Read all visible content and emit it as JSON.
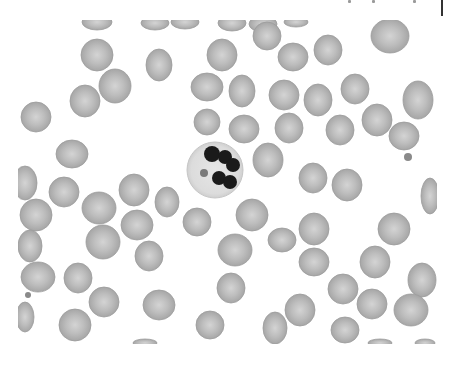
{
  "image": {
    "subject": "Peripheral blood smear micrograph (grayscale) showing a central segmented neutrophil surrounded by red blood cells",
    "frame": {
      "x": 18,
      "y": 20,
      "width": 419,
      "height": 324
    },
    "colors": {
      "background": "#ffffff",
      "rbc_fill": "#b9b9b9",
      "rbc_edge": "#9c9c9c",
      "rbc_center": "#d6d6d6",
      "wbc_cytoplasm": "#dedede",
      "wbc_nucleus": "#1a1a1a",
      "platelet": "#8a8a8a"
    },
    "neutrophil": {
      "cx": 215,
      "cy": 170,
      "r": 28,
      "lobes": [
        {
          "cx": 212,
          "cy": 154,
          "r": 8
        },
        {
          "cx": 225,
          "cy": 157,
          "r": 7
        },
        {
          "cx": 233,
          "cy": 165,
          "r": 7
        },
        {
          "cx": 219,
          "cy": 178,
          "r": 7
        },
        {
          "cx": 230,
          "cy": 182,
          "r": 7
        }
      ],
      "granule": {
        "cx": 204,
        "cy": 173,
        "r": 4
      }
    },
    "red_cells": [
      {
        "cx": 97,
        "cy": 22,
        "rx": 15,
        "ry": 8
      },
      {
        "cx": 155,
        "cy": 23,
        "rx": 14,
        "ry": 7
      },
      {
        "cx": 185,
        "cy": 22,
        "rx": 14,
        "ry": 7
      },
      {
        "cx": 232,
        "cy": 23,
        "rx": 14,
        "ry": 8
      },
      {
        "cx": 263,
        "cy": 24,
        "rx": 14,
        "ry": 8
      },
      {
        "cx": 296,
        "cy": 22,
        "rx": 12,
        "ry": 5
      },
      {
        "cx": 390,
        "cy": 36,
        "rx": 19,
        "ry": 17
      },
      {
        "cx": 97,
        "cy": 55,
        "rx": 16,
        "ry": 16
      },
      {
        "cx": 159,
        "cy": 65,
        "rx": 13,
        "ry": 16
      },
      {
        "cx": 222,
        "cy": 55,
        "rx": 15,
        "ry": 16
      },
      {
        "cx": 267,
        "cy": 36,
        "rx": 14,
        "ry": 14
      },
      {
        "cx": 293,
        "cy": 57,
        "rx": 15,
        "ry": 14
      },
      {
        "cx": 328,
        "cy": 50,
        "rx": 14,
        "ry": 15
      },
      {
        "cx": 115,
        "cy": 86,
        "rx": 16,
        "ry": 17
      },
      {
        "cx": 85,
        "cy": 101,
        "rx": 15,
        "ry": 16
      },
      {
        "cx": 207,
        "cy": 87,
        "rx": 16,
        "ry": 14
      },
      {
        "cx": 242,
        "cy": 91,
        "rx": 13,
        "ry": 16
      },
      {
        "cx": 284,
        "cy": 95,
        "rx": 15,
        "ry": 15
      },
      {
        "cx": 318,
        "cy": 100,
        "rx": 14,
        "ry": 16
      },
      {
        "cx": 355,
        "cy": 89,
        "rx": 14,
        "ry": 15
      },
      {
        "cx": 418,
        "cy": 100,
        "rx": 15,
        "ry": 19
      },
      {
        "cx": 36,
        "cy": 117,
        "rx": 15,
        "ry": 15
      },
      {
        "cx": 207,
        "cy": 122,
        "rx": 13,
        "ry": 13
      },
      {
        "cx": 244,
        "cy": 129,
        "rx": 15,
        "ry": 14
      },
      {
        "cx": 289,
        "cy": 128,
        "rx": 14,
        "ry": 15
      },
      {
        "cx": 340,
        "cy": 130,
        "rx": 14,
        "ry": 15
      },
      {
        "cx": 377,
        "cy": 120,
        "rx": 15,
        "ry": 16
      },
      {
        "cx": 404,
        "cy": 136,
        "rx": 15,
        "ry": 14
      },
      {
        "cx": 72,
        "cy": 154,
        "rx": 16,
        "ry": 14
      },
      {
        "cx": 268,
        "cy": 160,
        "rx": 15,
        "ry": 17
      },
      {
        "cx": 313,
        "cy": 178,
        "rx": 14,
        "ry": 15
      },
      {
        "cx": 347,
        "cy": 185,
        "rx": 15,
        "ry": 16
      },
      {
        "cx": 25,
        "cy": 183,
        "rx": 12,
        "ry": 17
      },
      {
        "cx": 64,
        "cy": 192,
        "rx": 15,
        "ry": 15
      },
      {
        "cx": 134,
        "cy": 190,
        "rx": 15,
        "ry": 16
      },
      {
        "cx": 99,
        "cy": 208,
        "rx": 17,
        "ry": 16
      },
      {
        "cx": 167,
        "cy": 202,
        "rx": 12,
        "ry": 15
      },
      {
        "cx": 197,
        "cy": 222,
        "rx": 14,
        "ry": 14
      },
      {
        "cx": 252,
        "cy": 215,
        "rx": 16,
        "ry": 16
      },
      {
        "cx": 430,
        "cy": 196,
        "rx": 9,
        "ry": 18
      },
      {
        "cx": 36,
        "cy": 215,
        "rx": 16,
        "ry": 16
      },
      {
        "cx": 137,
        "cy": 225,
        "rx": 16,
        "ry": 15
      },
      {
        "cx": 314,
        "cy": 229,
        "rx": 15,
        "ry": 16
      },
      {
        "cx": 394,
        "cy": 229,
        "rx": 16,
        "ry": 16
      },
      {
        "cx": 30,
        "cy": 246,
        "rx": 12,
        "ry": 16
      },
      {
        "cx": 103,
        "cy": 242,
        "rx": 17,
        "ry": 17
      },
      {
        "cx": 149,
        "cy": 256,
        "rx": 14,
        "ry": 15
      },
      {
        "cx": 235,
        "cy": 250,
        "rx": 17,
        "ry": 16
      },
      {
        "cx": 282,
        "cy": 240,
        "rx": 14,
        "ry": 12
      },
      {
        "cx": 314,
        "cy": 262,
        "rx": 15,
        "ry": 14
      },
      {
        "cx": 375,
        "cy": 262,
        "rx": 15,
        "ry": 16
      },
      {
        "cx": 38,
        "cy": 277,
        "rx": 17,
        "ry": 15
      },
      {
        "cx": 78,
        "cy": 278,
        "rx": 14,
        "ry": 15
      },
      {
        "cx": 231,
        "cy": 288,
        "rx": 14,
        "ry": 15
      },
      {
        "cx": 343,
        "cy": 289,
        "rx": 15,
        "ry": 15
      },
      {
        "cx": 422,
        "cy": 280,
        "rx": 14,
        "ry": 17
      },
      {
        "cx": 104,
        "cy": 302,
        "rx": 15,
        "ry": 15
      },
      {
        "cx": 159,
        "cy": 305,
        "rx": 16,
        "ry": 15
      },
      {
        "cx": 300,
        "cy": 310,
        "rx": 15,
        "ry": 16
      },
      {
        "cx": 372,
        "cy": 304,
        "rx": 15,
        "ry": 15
      },
      {
        "cx": 411,
        "cy": 310,
        "rx": 17,
        "ry": 16
      },
      {
        "cx": 25,
        "cy": 317,
        "rx": 9,
        "ry": 15
      },
      {
        "cx": 75,
        "cy": 325,
        "rx": 16,
        "ry": 16
      },
      {
        "cx": 210,
        "cy": 325,
        "rx": 14,
        "ry": 14
      },
      {
        "cx": 275,
        "cy": 328,
        "rx": 12,
        "ry": 16
      },
      {
        "cx": 345,
        "cy": 330,
        "rx": 14,
        "ry": 13
      },
      {
        "cx": 145,
        "cy": 343,
        "rx": 12,
        "ry": 4
      },
      {
        "cx": 380,
        "cy": 343,
        "rx": 12,
        "ry": 4
      },
      {
        "cx": 425,
        "cy": 343,
        "rx": 10,
        "ry": 4
      }
    ],
    "platelets": [
      {
        "cx": 408,
        "cy": 157,
        "r": 4
      },
      {
        "cx": 28,
        "cy": 295,
        "r": 3
      }
    ]
  }
}
